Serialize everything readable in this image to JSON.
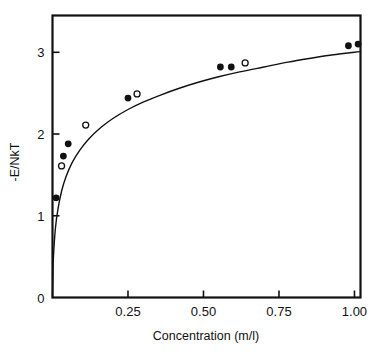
{
  "chart_data": {
    "type": "scatter",
    "title": "",
    "subtitle": "",
    "xlabel": "Concentration (m/l)",
    "ylabel": "-E/NkT",
    "xlim": [
      0,
      1.02
    ],
    "ylim": [
      0,
      3.45
    ],
    "grid": false,
    "legend_position": "none",
    "x_ticks": [
      0.25,
      0.5,
      0.75,
      1.0
    ],
    "x_tick_labels": [
      "0.25",
      "0.50",
      "0.75",
      "1.00"
    ],
    "y_ticks": [
      0,
      1,
      2,
      3
    ],
    "y_tick_labels": [
      "0",
      "1",
      "2",
      "3"
    ],
    "tick_direction": "in",
    "series": [
      {
        "name": "filled-circles",
        "marker": "filled-circle",
        "color": "#111111",
        "points": [
          {
            "x": 0.012,
            "y": 1.22
          },
          {
            "x": 0.036,
            "y": 1.73
          },
          {
            "x": 0.052,
            "y": 1.88
          },
          {
            "x": 0.25,
            "y": 2.44
          },
          {
            "x": 0.556,
            "y": 2.82
          },
          {
            "x": 0.592,
            "y": 2.82
          },
          {
            "x": 0.98,
            "y": 3.08
          },
          {
            "x": 1.012,
            "y": 3.1
          }
        ]
      },
      {
        "name": "open-circles",
        "marker": "open-circle",
        "color": "#111111",
        "points": [
          {
            "x": 0.03,
            "y": 1.61
          },
          {
            "x": 0.11,
            "y": 2.11
          },
          {
            "x": 0.28,
            "y": 2.49
          },
          {
            "x": 0.638,
            "y": 2.87
          }
        ]
      },
      {
        "name": "theoretical-curve",
        "marker": "line",
        "color": "#111111",
        "points": [
          {
            "x": 0.0,
            "y": 0.0
          },
          {
            "x": 0.002,
            "y": 0.4
          },
          {
            "x": 0.005,
            "y": 0.62
          },
          {
            "x": 0.01,
            "y": 0.86
          },
          {
            "x": 0.018,
            "y": 1.08
          },
          {
            "x": 0.03,
            "y": 1.3
          },
          {
            "x": 0.045,
            "y": 1.48
          },
          {
            "x": 0.065,
            "y": 1.65
          },
          {
            "x": 0.09,
            "y": 1.8
          },
          {
            "x": 0.12,
            "y": 1.94
          },
          {
            "x": 0.16,
            "y": 2.08
          },
          {
            "x": 0.2,
            "y": 2.19
          },
          {
            "x": 0.25,
            "y": 2.3
          },
          {
            "x": 0.3,
            "y": 2.39
          },
          {
            "x": 0.36,
            "y": 2.48
          },
          {
            "x": 0.42,
            "y": 2.56
          },
          {
            "x": 0.48,
            "y": 2.63
          },
          {
            "x": 0.55,
            "y": 2.7
          },
          {
            "x": 0.62,
            "y": 2.76
          },
          {
            "x": 0.7,
            "y": 2.82
          },
          {
            "x": 0.78,
            "y": 2.88
          },
          {
            "x": 0.86,
            "y": 2.93
          },
          {
            "x": 0.93,
            "y": 2.97
          },
          {
            "x": 1.0,
            "y": 3.0
          },
          {
            "x": 1.02,
            "y": 3.01
          }
        ]
      }
    ]
  },
  "axes": {
    "x_axis_label": "Concentration (m/l)",
    "y_axis_label": "-E/NkT",
    "x_tick_labels": [
      "0.25",
      "0.50",
      "0.75",
      "1.00"
    ],
    "y_tick_labels": [
      "0",
      "1",
      "2",
      "3"
    ]
  },
  "colors": {
    "ink": "#111111",
    "background": "#ffffff",
    "frame": "#111111"
  }
}
